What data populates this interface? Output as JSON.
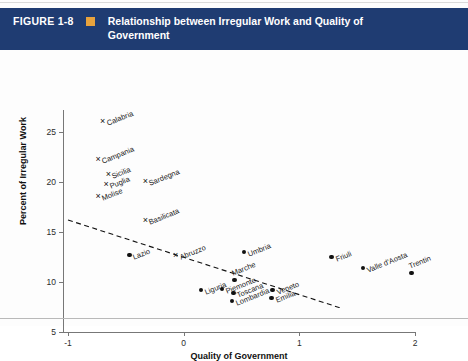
{
  "banner": {
    "figure_number": "FIGURE 1-8",
    "title": "Relationship between Irregular Work and Quality of Government",
    "bullet_icon": "orange-square-icon",
    "bg_color": "#1f3c72",
    "square_color": "#e8a33d",
    "text_color": "#ffffff"
  },
  "chart_data": {
    "type": "scatter",
    "title": "Relationship between Irregular Work and Quality of Government",
    "xlabel": "Quality of Government",
    "ylabel": "Percent of Irregular Work",
    "xlim": [
      -1,
      2
    ],
    "ylim": [
      5,
      26.5
    ],
    "xticks": [
      "-1",
      "0",
      "1",
      "2"
    ],
    "yticks": [
      "5",
      "10",
      "15",
      "20",
      "25"
    ],
    "grid": false,
    "legend": "none",
    "marker_styles": {
      "cross": "southern regions (x marker)",
      "dot": "central and northern regions (filled circle)"
    },
    "points": [
      {
        "label": "Calabria",
        "x": -0.7,
        "y": 26.1,
        "marker": "cross",
        "label_pos": "right"
      },
      {
        "label": "Campania",
        "x": -0.74,
        "y": 22.3,
        "marker": "cross",
        "label_pos": "right"
      },
      {
        "label": "Sicilia",
        "x": -0.65,
        "y": 20.8,
        "marker": "cross",
        "label_pos": "right"
      },
      {
        "label": "Puglia",
        "x": -0.67,
        "y": 19.8,
        "marker": "cross",
        "label_pos": "right"
      },
      {
        "label": "Molise",
        "x": -0.74,
        "y": 18.6,
        "marker": "cross",
        "label_pos": "right"
      },
      {
        "label": "Sardegna",
        "x": -0.33,
        "y": 20.1,
        "marker": "cross",
        "label_pos": "right"
      },
      {
        "label": "Basilicata",
        "x": -0.33,
        "y": 16.2,
        "marker": "cross",
        "label_pos": "right"
      },
      {
        "label": "Lazio",
        "x": -0.47,
        "y": 12.7,
        "marker": "dot",
        "label_pos": "right"
      },
      {
        "label": "Abruzzo",
        "x": -0.07,
        "y": 12.7,
        "marker": "cross",
        "label_pos": "right"
      },
      {
        "label": "Umbria",
        "x": 0.52,
        "y": 13.0,
        "marker": "dot",
        "label_pos": "right"
      },
      {
        "label": "Marche",
        "x": 0.44,
        "y": 10.2,
        "marker": "dot",
        "label_pos": "up"
      },
      {
        "label": "Liguria",
        "x": 0.15,
        "y": 9.2,
        "marker": "dot",
        "label_pos": "right"
      },
      {
        "label": "Piemonte",
        "x": 0.33,
        "y": 9.3,
        "marker": "dot",
        "label_pos": "right"
      },
      {
        "label": "Toscana",
        "x": 0.43,
        "y": 8.9,
        "marker": "dot",
        "label_pos": "right"
      },
      {
        "label": "Lombardia",
        "x": 0.42,
        "y": 8.1,
        "marker": "dot",
        "label_pos": "right"
      },
      {
        "label": "Veneto",
        "x": 0.77,
        "y": 9.2,
        "marker": "dot",
        "label_pos": "right"
      },
      {
        "label": "Emilia",
        "x": 0.76,
        "y": 8.4,
        "marker": "dot",
        "label_pos": "right"
      },
      {
        "label": "Friuli",
        "x": 1.28,
        "y": 12.5,
        "marker": "dot",
        "label_pos": "right"
      },
      {
        "label": "Valle d'Aosta",
        "x": 1.55,
        "y": 11.4,
        "marker": "dot",
        "label_pos": "right"
      },
      {
        "label": "Trentin",
        "x": 1.97,
        "y": 10.9,
        "marker": "dot",
        "label_pos": "up"
      }
    ],
    "trendline": {
      "style": "dashed",
      "x_start": -1.0,
      "y_start": 16.2,
      "x_end": 2.0,
      "y_end": 5.0,
      "slope": -3.73,
      "intercept": 12.47
    }
  }
}
